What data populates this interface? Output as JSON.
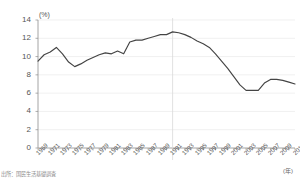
{
  "chart_data": {
    "type": "line",
    "title": "",
    "subtitle": "",
    "xlabel": "(年)",
    "ylabel": "(%)",
    "ylim": [
      0,
      14
    ],
    "xlim": [
      1969,
      2011
    ],
    "grid": true,
    "legend": null,
    "y_ticks": [
      "0",
      "2",
      "4",
      "6",
      "8",
      "10",
      "12",
      "14"
    ],
    "y_tick_values": [
      0,
      2,
      4,
      6,
      8,
      10,
      12,
      14
    ],
    "x_ticks": [
      "1969",
      "1971",
      "1973",
      "1975",
      "1977",
      "1979",
      "1981",
      "1983",
      "1985",
      "1987",
      "1989",
      "1991",
      "1993",
      "1995",
      "1997",
      "1999",
      "2001",
      "2003",
      "2005",
      "2007",
      "2009",
      "2011"
    ],
    "x_tick_values": [
      1969,
      1971,
      1973,
      1975,
      1977,
      1979,
      1981,
      1983,
      1985,
      1987,
      1989,
      1991,
      1993,
      1995,
      1997,
      1999,
      2001,
      2003,
      2005,
      2007,
      2009,
      2011
    ],
    "series": [
      {
        "name": "series-1",
        "color": "#444444",
        "x": [
          1969,
          1970,
          1971,
          1972,
          1973,
          1974,
          1975,
          1976,
          1977,
          1978,
          1979,
          1980,
          1981,
          1982,
          1983,
          1984,
          1985,
          1986,
          1987,
          1988,
          1989,
          1990,
          1991,
          1992,
          1993,
          1994,
          1995,
          1996,
          1997,
          1998,
          1999,
          2000,
          2001,
          2002,
          2003,
          2004,
          2005,
          2006,
          2007,
          2008,
          2009,
          2010,
          2011
        ],
        "values": [
          9.5,
          10.2,
          10.5,
          11.0,
          10.3,
          9.4,
          8.9,
          9.2,
          9.6,
          9.9,
          10.2,
          10.4,
          10.3,
          10.6,
          10.3,
          11.6,
          11.8,
          11.8,
          12.0,
          12.2,
          12.4,
          12.4,
          12.7,
          12.6,
          12.4,
          12.1,
          11.7,
          11.4,
          11.0,
          10.3,
          9.5,
          8.7,
          7.8,
          6.9,
          6.3,
          6.3,
          6.3,
          7.1,
          7.5,
          7.5,
          7.4,
          7.2,
          7.0
        ]
      }
    ],
    "reference_line_x": 1991
  },
  "notes": {
    "source": "出所：国民生活基礎調査"
  },
  "icons": {
    "none": ""
  }
}
